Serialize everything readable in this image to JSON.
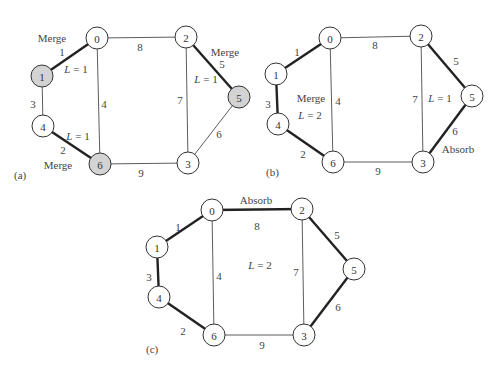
{
  "colors": {
    "merged_node_fill": "#d3d3d3",
    "node_fill": "#ffffff",
    "edge": "#333333"
  },
  "panels": [
    {
      "id": "a",
      "label": "(a)",
      "nodes": [
        {
          "id": "0",
          "label": "0",
          "shaded": false
        },
        {
          "id": "1",
          "label": "1",
          "shaded": true
        },
        {
          "id": "2",
          "label": "2",
          "shaded": false
        },
        {
          "id": "3",
          "label": "3",
          "shaded": false
        },
        {
          "id": "4",
          "label": "4",
          "shaded": false
        },
        {
          "id": "5",
          "label": "5",
          "shaded": true
        },
        {
          "id": "6",
          "label": "6",
          "shaded": true
        }
      ],
      "edges": [
        {
          "from": "0",
          "to": "1",
          "weight": "1",
          "bold": true
        },
        {
          "from": "4",
          "to": "6",
          "weight": "2",
          "bold": true
        },
        {
          "from": "1",
          "to": "4",
          "weight": "3",
          "bold": false
        },
        {
          "from": "0",
          "to": "6",
          "weight": "4",
          "bold": false
        },
        {
          "from": "2",
          "to": "5",
          "weight": "5",
          "bold": true
        },
        {
          "from": "5",
          "to": "3",
          "weight": "6",
          "bold": false
        },
        {
          "from": "2",
          "to": "3",
          "weight": "7",
          "bold": false
        },
        {
          "from": "0",
          "to": "2",
          "weight": "8",
          "bold": false
        },
        {
          "from": "6",
          "to": "3",
          "weight": "9",
          "bold": false
        }
      ],
      "annotations": [
        "Merge",
        "Merge",
        "Merge"
      ],
      "levels": [
        "L = 1",
        "L = 1",
        "L = 1"
      ]
    },
    {
      "id": "b",
      "label": "(b)",
      "nodes": [
        {
          "id": "0",
          "label": "0",
          "shaded": false
        },
        {
          "id": "1",
          "label": "1",
          "shaded": false
        },
        {
          "id": "2",
          "label": "2",
          "shaded": false
        },
        {
          "id": "3",
          "label": "3",
          "shaded": false
        },
        {
          "id": "4",
          "label": "4",
          "shaded": false
        },
        {
          "id": "5",
          "label": "5",
          "shaded": false
        },
        {
          "id": "6",
          "label": "6",
          "shaded": false
        }
      ],
      "edges": [
        {
          "from": "0",
          "to": "1",
          "weight": "1",
          "bold": true
        },
        {
          "from": "4",
          "to": "6",
          "weight": "2",
          "bold": true
        },
        {
          "from": "1",
          "to": "4",
          "weight": "3",
          "bold": true
        },
        {
          "from": "0",
          "to": "6",
          "weight": "4",
          "bold": false
        },
        {
          "from": "2",
          "to": "5",
          "weight": "5",
          "bold": true
        },
        {
          "from": "5",
          "to": "3",
          "weight": "6",
          "bold": true
        },
        {
          "from": "2",
          "to": "3",
          "weight": "7",
          "bold": false
        },
        {
          "from": "0",
          "to": "2",
          "weight": "8",
          "bold": false
        },
        {
          "from": "6",
          "to": "3",
          "weight": "9",
          "bold": false
        }
      ],
      "annotations": [
        "Merge",
        "Absorb"
      ],
      "levels": [
        "L = 2",
        "L = 1"
      ]
    },
    {
      "id": "c",
      "label": "(c)",
      "nodes": [
        {
          "id": "0",
          "label": "0",
          "shaded": false
        },
        {
          "id": "1",
          "label": "1",
          "shaded": false
        },
        {
          "id": "2",
          "label": "2",
          "shaded": false
        },
        {
          "id": "3",
          "label": "3",
          "shaded": false
        },
        {
          "id": "4",
          "label": "4",
          "shaded": false
        },
        {
          "id": "5",
          "label": "5",
          "shaded": false
        },
        {
          "id": "6",
          "label": "6",
          "shaded": false
        }
      ],
      "edges": [
        {
          "from": "0",
          "to": "1",
          "weight": "1",
          "bold": true
        },
        {
          "from": "4",
          "to": "6",
          "weight": "2",
          "bold": true
        },
        {
          "from": "1",
          "to": "4",
          "weight": "3",
          "bold": true
        },
        {
          "from": "0",
          "to": "6",
          "weight": "4",
          "bold": false
        },
        {
          "from": "2",
          "to": "5",
          "weight": "5",
          "bold": true
        },
        {
          "from": "5",
          "to": "3",
          "weight": "6",
          "bold": true
        },
        {
          "from": "2",
          "to": "3",
          "weight": "7",
          "bold": false
        },
        {
          "from": "0",
          "to": "2",
          "weight": "8",
          "bold": true
        },
        {
          "from": "6",
          "to": "3",
          "weight": "9",
          "bold": false
        }
      ],
      "annotations": [
        "Absorb"
      ],
      "levels": [
        "L = 2"
      ]
    }
  ]
}
